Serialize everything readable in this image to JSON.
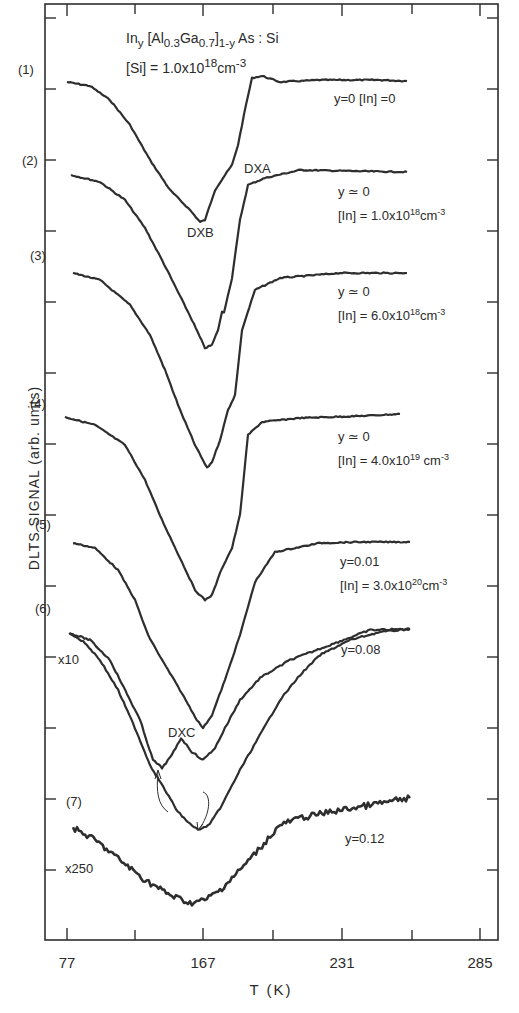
{
  "chart_data": {
    "type": "line",
    "subtitle": "[Si] = 1.0x10^18 cm^-3",
    "xlabel": "T (K)",
    "ylabel": "DLTS SIGNAL (arb. units)",
    "x_tick_labels": [
      "77",
      "167",
      "231",
      "285"
    ],
    "xlim": [
      77,
      285
    ],
    "grid": false,
    "legend_position": "inline labels at right of each curve",
    "annotations": [
      "DXA",
      "DXB",
      "DXC"
    ],
    "series": [
      {
        "name": "(1) y=0 [In]=0",
        "index": "(1)",
        "y": "0",
        "In": "0",
        "scale": "",
        "min_T": 167,
        "features": "DXB minimum near 167 K, DXA shoulder near 190 K",
        "points": [
          [
            67,
            82
          ],
          [
            90,
            86
          ],
          [
            110,
            100
          ],
          [
            130,
            125
          ],
          [
            150,
            160
          ],
          [
            170,
            190
          ],
          [
            190,
            210
          ],
          [
            200,
            222
          ],
          [
            205,
            220
          ],
          [
            215,
            190
          ],
          [
            225,
            175
          ],
          [
            232,
            165
          ],
          [
            238,
            145
          ],
          [
            246,
            105
          ],
          [
            252,
            78
          ],
          [
            262,
            76
          ],
          [
            280,
            82
          ],
          [
            320,
            80
          ],
          [
            380,
            80
          ],
          [
            407,
            81
          ]
        ]
      },
      {
        "name": "(2) y≈0 [In]=1.0x10^18 cm^-3",
        "index": "(2)",
        "y": "≃0",
        "In": "1.0x10^18 cm^-3",
        "scale": "",
        "min_T": 167,
        "points": [
          [
            71,
            175
          ],
          [
            100,
            182
          ],
          [
            125,
            200
          ],
          [
            145,
            228
          ],
          [
            162,
            260
          ],
          [
            178,
            292
          ],
          [
            192,
            320
          ],
          [
            205,
            348
          ],
          [
            212,
            345
          ],
          [
            218,
            330
          ],
          [
            222,
            312
          ],
          [
            224,
            312
          ],
          [
            232,
            278
          ],
          [
            240,
            220
          ],
          [
            248,
            185
          ],
          [
            265,
            178
          ],
          [
            300,
            170
          ],
          [
            350,
            171
          ],
          [
            407,
            172
          ]
        ]
      },
      {
        "name": "(3) y≈0 [In]=6.0x10^18 cm^-3",
        "index": "(3)",
        "y": "≃0",
        "In": "6.0x10^18 cm^-3",
        "scale": "",
        "min_T": 167,
        "points": [
          [
            73,
            273
          ],
          [
            100,
            280
          ],
          [
            130,
            305
          ],
          [
            150,
            335
          ],
          [
            165,
            370
          ],
          [
            180,
            410
          ],
          [
            195,
            445
          ],
          [
            207,
            468
          ],
          [
            212,
            462
          ],
          [
            220,
            440
          ],
          [
            228,
            410
          ],
          [
            235,
            395
          ],
          [
            242,
            330
          ],
          [
            255,
            290
          ],
          [
            280,
            278
          ],
          [
            340,
            273
          ],
          [
            407,
            273
          ]
        ]
      },
      {
        "name": "(4) y≈0 [In]=4.0x10^19 cm^-3",
        "index": "(4)",
        "y": "≃0",
        "In": "4.0x10^19 cm^-3",
        "scale": "",
        "min_T": 167,
        "points": [
          [
            65,
            417
          ],
          [
            95,
            425
          ],
          [
            125,
            445
          ],
          [
            145,
            480
          ],
          [
            162,
            520
          ],
          [
            180,
            558
          ],
          [
            195,
            590
          ],
          [
            205,
            600
          ],
          [
            212,
            595
          ],
          [
            222,
            568
          ],
          [
            232,
            548
          ],
          [
            240,
            515
          ],
          [
            248,
            435
          ],
          [
            262,
            422
          ],
          [
            300,
            418
          ],
          [
            360,
            416
          ],
          [
            400,
            414
          ]
        ]
      },
      {
        "name": "(5) y=0.01 [In]=3.0x10^20 cm^-3",
        "index": "(5)",
        "y": "0.01",
        "In": "3.0x10^20 cm^-3",
        "scale": "",
        "min_T": 167,
        "points": [
          [
            73,
            543
          ],
          [
            95,
            548
          ],
          [
            118,
            570
          ],
          [
            135,
            600
          ],
          [
            148,
            635
          ],
          [
            162,
            660
          ],
          [
            180,
            690
          ],
          [
            197,
            720
          ],
          [
            203,
            728
          ],
          [
            212,
            715
          ],
          [
            225,
            680
          ],
          [
            240,
            635
          ],
          [
            255,
            582
          ],
          [
            275,
            552
          ],
          [
            320,
            543
          ],
          [
            360,
            542
          ],
          [
            410,
            542
          ]
        ]
      },
      {
        "name": "(6) y=0.08",
        "index": "(6)",
        "y": "0.08",
        "In": "",
        "scale": "x10",
        "min_T": [
          140,
          167
        ],
        "features": "double minimum: DXC near 140 K and DX near 167 K",
        "points": [
          [
            69,
            633
          ],
          [
            90,
            640
          ],
          [
            110,
            660
          ],
          [
            125,
            690
          ],
          [
            140,
            720
          ],
          [
            153,
            760
          ],
          [
            162,
            768
          ],
          [
            172,
            755
          ],
          [
            181,
            738
          ],
          [
            192,
            752
          ],
          [
            203,
            760
          ],
          [
            215,
            748
          ],
          [
            225,
            728
          ],
          [
            240,
            700
          ],
          [
            260,
            678
          ],
          [
            290,
            660
          ],
          [
            330,
            645
          ],
          [
            370,
            630
          ],
          [
            410,
            629
          ]
        ]
      },
      {
        "name": "(6) y=0.08 (x10 companion)",
        "index": "(6)",
        "y": "0.08",
        "In": "",
        "scale": "x10",
        "min_T": 160,
        "points": [
          [
            70,
            633
          ],
          [
            85,
            643
          ],
          [
            100,
            660
          ],
          [
            118,
            690
          ],
          [
            135,
            728
          ],
          [
            150,
            765
          ],
          [
            165,
            790
          ],
          [
            178,
            812
          ],
          [
            192,
            826
          ],
          [
            200,
            830
          ],
          [
            210,
            824
          ],
          [
            222,
            805
          ],
          [
            240,
            770
          ],
          [
            260,
            735
          ],
          [
            280,
            700
          ],
          [
            300,
            675
          ],
          [
            320,
            655
          ],
          [
            350,
            640
          ],
          [
            380,
            632
          ],
          [
            410,
            629
          ]
        ]
      },
      {
        "name": "(7) y=0.12",
        "index": "(7)",
        "y": "0.12",
        "In": "",
        "scale": "x250",
        "min_T": 162,
        "features": "broad noisy minimum",
        "points": [
          [
            73,
            828
          ],
          [
            95,
            840
          ],
          [
            120,
            860
          ],
          [
            145,
            880
          ],
          [
            170,
            895
          ],
          [
            190,
            903
          ],
          [
            205,
            900
          ],
          [
            220,
            890
          ],
          [
            240,
            870
          ],
          [
            260,
            848
          ],
          [
            280,
            825
          ],
          [
            300,
            818
          ],
          [
            330,
            812
          ],
          [
            370,
            805
          ],
          [
            410,
            798
          ]
        ]
      }
    ]
  },
  "title": {
    "line1_main": "In",
    "line1_sub_y": "y",
    "line1_bracket": " [Al",
    "line1_sub_03": "0.3",
    "line1_ga": "Ga",
    "line1_sub_07": "0.7",
    "line1_close": "]",
    "line1_sub_1y": "1-y",
    "line1_tail": " As : Si",
    "line2_main": "[Si] = 1.0x10",
    "line2_sup": "18",
    "line2_unit": "cm",
    "line2_unit_sup": "-3"
  },
  "axes": {
    "xlabel": "T (K)",
    "ylabel": "DLTS SIGNAL (arb. units)",
    "x_ticks": [
      {
        "label": "77",
        "px": 67
      },
      {
        "label": "167",
        "px": 203
      },
      {
        "label": "231",
        "px": 342
      },
      {
        "label": "285",
        "px": 480
      }
    ]
  },
  "curve_labels": {
    "c1": "(1)",
    "c2": "(2)",
    "c3": "(3)",
    "c4": "(4)",
    "c5": "(5)",
    "c6": "(6)",
    "c7": "(7)",
    "scale6": "x10",
    "scale7": "x250"
  },
  "annotations": {
    "dxa": "DXA",
    "dxb": "DXB",
    "dxc": "DXC"
  },
  "legends": {
    "l1": "y=0  [In] =0",
    "l2a": "y ≃ 0",
    "l2b_main": "[In] = 1.0x10",
    "l2b_sup": "18",
    "l2b_unit": "cm",
    "l2b_usup": "-3",
    "l3a": "y ≃ 0",
    "l3b_main": "[In] = 6.0x10",
    "l3b_sup": "18",
    "l3b_unit": "cm",
    "l3b_usup": "-3",
    "l4a": "y ≃ 0",
    "l4b_main": "[In] = 4.0x10",
    "l4b_sup": "19",
    "l4b_unit": " cm",
    "l4b_usup": "-3",
    "l5a": "y=0.01",
    "l5b_main": "[In] = 3.0x10",
    "l5b_sup": "20",
    "l5b_unit": "cm",
    "l5b_usup": "-3",
    "l6": "y=0.08",
    "l7": "y=0.12"
  },
  "colors": {
    "ink": "#2e2e2e",
    "background": "#ffffff"
  }
}
